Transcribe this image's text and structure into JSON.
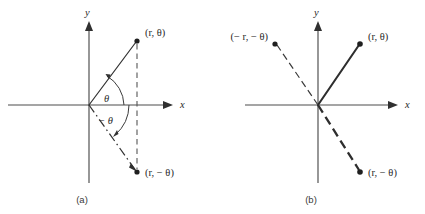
{
  "figure": {
    "kind": "math-diagram",
    "background_color": "#ffffff",
    "stroke_color": "#333333"
  },
  "panels": [
    {
      "id": "panel-a",
      "caption": "(a)",
      "axes": {
        "x_label": "x",
        "y_label": "y"
      },
      "points": [
        {
          "id": "a-point-1",
          "label": "(r, θ)",
          "quadrant": "I"
        },
        {
          "id": "a-point-2",
          "label": "(r, − θ)",
          "quadrant": "IV"
        }
      ],
      "angles": [
        {
          "id": "a-angle-positive",
          "label": "θ",
          "sense": "counterclockwise"
        },
        {
          "id": "a-angle-negative",
          "label": "− θ",
          "sense": "clockwise"
        }
      ]
    },
    {
      "id": "panel-b",
      "caption": "(b)",
      "axes": {
        "x_label": "x",
        "y_label": "y"
      },
      "points": [
        {
          "id": "b-point-1",
          "label": "(r, θ)",
          "quadrant": "I"
        },
        {
          "id": "b-point-2",
          "label": "(− r, − θ)",
          "quadrant": "II"
        },
        {
          "id": "b-point-3",
          "label": "(r, − θ)",
          "quadrant": "IV"
        }
      ],
      "angles": []
    }
  ]
}
